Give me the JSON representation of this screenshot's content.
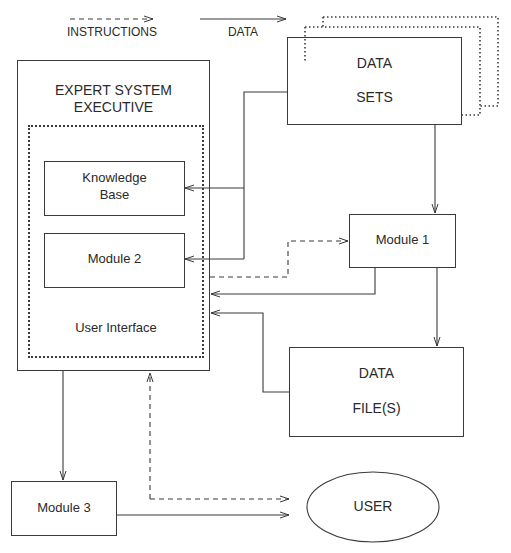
{
  "legend": {
    "instructions_label": "INSTRUCTIONS",
    "data_label": "DATA"
  },
  "nodes": {
    "executive": {
      "line1": "EXPERT SYSTEM",
      "line2": "EXECUTIVE"
    },
    "knowledge_base": {
      "line1": "Knowledge",
      "line2": "Base"
    },
    "module2": {
      "label": "Module 2"
    },
    "user_interface": {
      "label": "User Interface"
    },
    "data_sets": {
      "line1": "DATA",
      "line2": "SETS"
    },
    "module1": {
      "label": "Module 1"
    },
    "data_files": {
      "line1": "DATA",
      "line2": "FILE(S)"
    },
    "module3": {
      "label": "Module 3"
    },
    "user": {
      "label": "USER"
    }
  },
  "edges": [
    {
      "from": "data_sets",
      "to": "knowledge_base",
      "type": "data"
    },
    {
      "from": "data_sets",
      "to": "module2",
      "type": "data"
    },
    {
      "from": "data_sets",
      "to": "module1",
      "type": "data"
    },
    {
      "from": "executive",
      "to": "module1",
      "type": "instructions"
    },
    {
      "from": "module1",
      "to": "executive",
      "type": "data"
    },
    {
      "from": "module1",
      "to": "data_files",
      "type": "data"
    },
    {
      "from": "data_files",
      "to": "executive",
      "type": "data"
    },
    {
      "from": "executive",
      "to": "module3",
      "type": "data"
    },
    {
      "from": "module3",
      "to": "user",
      "type": "data"
    },
    {
      "from": "user",
      "to": "executive",
      "type": "instructions",
      "bidirectional": true
    }
  ]
}
